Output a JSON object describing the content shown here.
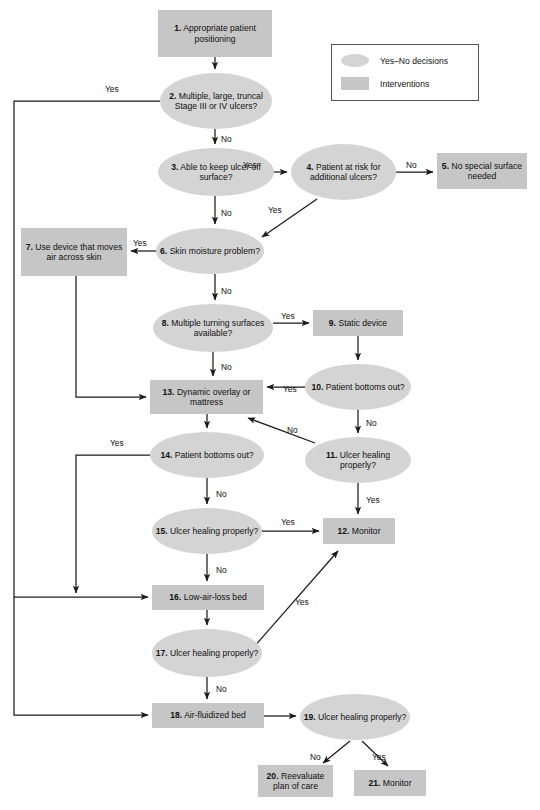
{
  "diagram": {
    "kind": "clinical-decision-flowchart",
    "colors": {
      "intervention_fill": "#c6c6c6",
      "decision_fill": "#d4d4d4",
      "edge_stroke": "#1a1a1a",
      "background": "#ffffff"
    }
  },
  "legend": {
    "rows": [
      {
        "shape": "ellipse",
        "label": "Yes–No decisions"
      },
      {
        "shape": "box",
        "label": "Interventions"
      }
    ]
  },
  "nodes": [
    {
      "id": 1,
      "num": "1.",
      "text": "Appropriate patient positioning",
      "shape": "box",
      "x": 158,
      "y": 10,
      "w": 114,
      "h": 47
    },
    {
      "id": 2,
      "num": "2.",
      "text": "Multiple, large, truncal Stage III or IV ulcers?",
      "shape": "ellipse",
      "x": 160,
      "y": 73,
      "w": 112,
      "h": 56
    },
    {
      "id": 3,
      "num": "3.",
      "text": "Able to keep ulcer off surface?",
      "shape": "ellipse",
      "x": 158,
      "y": 148,
      "w": 116,
      "h": 48
    },
    {
      "id": 4,
      "num": "4.",
      "text": "Patient at risk for additional ulcers?",
      "shape": "ellipse",
      "x": 291,
      "y": 144,
      "w": 105,
      "h": 56
    },
    {
      "id": 5,
      "num": "5.",
      "text": "No special surface needed",
      "shape": "box",
      "x": 437,
      "y": 153,
      "w": 90,
      "h": 36
    },
    {
      "id": 6,
      "num": "6.",
      "text": "Skin moisture problem?",
      "shape": "ellipse",
      "x": 156,
      "y": 228,
      "w": 108,
      "h": 46
    },
    {
      "id": 7,
      "num": "7.",
      "text": "Use device that moves air across skin",
      "shape": "box",
      "x": 21,
      "y": 228,
      "w": 106,
      "h": 48
    },
    {
      "id": 8,
      "num": "8.",
      "text": "Multiple turning surfaces available?",
      "shape": "ellipse",
      "x": 153,
      "y": 304,
      "w": 120,
      "h": 48
    },
    {
      "id": 9,
      "num": "9.",
      "text": "Static device",
      "shape": "box",
      "x": 313,
      "y": 310,
      "w": 90,
      "h": 26
    },
    {
      "id": 10,
      "num": "10.",
      "text": "Patient bottoms out?",
      "shape": "ellipse",
      "x": 305,
      "y": 364,
      "w": 106,
      "h": 46
    },
    {
      "id": 11,
      "num": "11.",
      "text": "Ulcer healing properly?",
      "shape": "ellipse",
      "x": 305,
      "y": 437,
      "w": 106,
      "h": 46
    },
    {
      "id": 12,
      "num": "12.",
      "text": "Monitor",
      "shape": "box",
      "x": 323,
      "y": 518,
      "w": 72,
      "h": 26
    },
    {
      "id": 13,
      "num": "13.",
      "text": "Dynamic overlay or mattress",
      "shape": "box",
      "x": 150,
      "y": 380,
      "w": 113,
      "h": 34
    },
    {
      "id": 14,
      "num": "14.",
      "text": "Patient bottoms out?",
      "shape": "ellipse",
      "x": 150,
      "y": 432,
      "w": 114,
      "h": 46
    },
    {
      "id": 15,
      "num": "15.",
      "text": "Ulcer healing properly?",
      "shape": "ellipse",
      "x": 152,
      "y": 508,
      "w": 110,
      "h": 46
    },
    {
      "id": 16,
      "num": "16.",
      "text": "Low-air-loss bed",
      "shape": "box",
      "x": 152,
      "y": 585,
      "w": 112,
      "h": 25
    },
    {
      "id": 17,
      "num": "17.",
      "text": "Ulcer healing properly?",
      "shape": "ellipse",
      "x": 152,
      "y": 629,
      "w": 110,
      "h": 48
    },
    {
      "id": 18,
      "num": "18.",
      "text": "Air-fluidized bed",
      "shape": "box",
      "x": 152,
      "y": 703,
      "w": 112,
      "h": 25
    },
    {
      "id": 19,
      "num": "19.",
      "text": "Ulcer healing properly?",
      "shape": "ellipse",
      "x": 300,
      "y": 694,
      "w": 110,
      "h": 46
    },
    {
      "id": 20,
      "num": "20.",
      "text": "Reevaluate plan of care",
      "shape": "box",
      "x": 258,
      "y": 765,
      "w": 75,
      "h": 32
    },
    {
      "id": 21,
      "num": "21.",
      "text": "Monitor",
      "shape": "box",
      "x": 354,
      "y": 770,
      "w": 72,
      "h": 26
    }
  ],
  "edge_labels": [
    {
      "id": "e2-yes",
      "text": "Yes",
      "x": 105,
      "y": 84
    },
    {
      "id": "e2-no",
      "text": "No",
      "x": 221,
      "y": 134
    },
    {
      "id": "e3-yes",
      "text": "Yes",
      "x": 243,
      "y": 160
    },
    {
      "id": "e3-no",
      "text": "No",
      "x": 221,
      "y": 208
    },
    {
      "id": "e4-no",
      "text": "No",
      "x": 406,
      "y": 160
    },
    {
      "id": "e4-yes",
      "text": "Yes",
      "x": 268,
      "y": 205
    },
    {
      "id": "e6-yes",
      "text": "Yes",
      "x": 133,
      "y": 238
    },
    {
      "id": "e6-no",
      "text": "No",
      "x": 221,
      "y": 286
    },
    {
      "id": "e8-yes",
      "text": "Yes",
      "x": 281,
      "y": 311
    },
    {
      "id": "e8-no",
      "text": "No",
      "x": 221,
      "y": 362
    },
    {
      "id": "e10-yes",
      "text": "Yes",
      "x": 283,
      "y": 384
    },
    {
      "id": "e10-no",
      "text": "No",
      "x": 366,
      "y": 418
    },
    {
      "id": "e11-no",
      "text": "No",
      "x": 287,
      "y": 425
    },
    {
      "id": "e11-yes",
      "text": "Yes",
      "x": 366,
      "y": 495
    },
    {
      "id": "e14-yes",
      "text": "Yes",
      "x": 110,
      "y": 438
    },
    {
      "id": "e14-no",
      "text": "No",
      "x": 216,
      "y": 489
    },
    {
      "id": "e15-yes",
      "text": "Yes",
      "x": 281,
      "y": 517
    },
    {
      "id": "e15-no",
      "text": "No",
      "x": 216,
      "y": 565
    },
    {
      "id": "e17-yes",
      "text": "Yes",
      "x": 295,
      "y": 597
    },
    {
      "id": "e17-no",
      "text": "No",
      "x": 216,
      "y": 684
    },
    {
      "id": "e19-no",
      "text": "No",
      "x": 310,
      "y": 752
    },
    {
      "id": "e19-yes",
      "text": "Yes",
      "x": 372,
      "y": 752
    }
  ]
}
